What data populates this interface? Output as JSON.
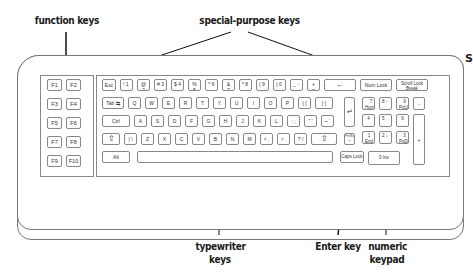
{
  "labels": {
    "function_keys": "function keys",
    "special_purpose_keys": "special-purpose keys",
    "typewriter_keys_line1": "typewriter",
    "typewriter_keys_line2": "keys",
    "enter_key": "Enter key",
    "numeric_keypad_line1": "numeric",
    "numeric_keypad_line2": "keypad",
    "cut_off_right": "S"
  },
  "function_keys": [
    "F1",
    "F2",
    "F3",
    "F4",
    "F5",
    "F6",
    "F7",
    "F8",
    "F9",
    "F10"
  ],
  "rows": {
    "number_row": [
      "Esc",
      "! 1",
      "@ 2",
      "# 3",
      "$ 4",
      "% 5",
      "^ 6",
      "& 7",
      "* 8",
      "( 9",
      ") 0",
      "_ -",
      "+ =",
      "←"
    ],
    "top_special": [
      "Num Lock",
      "Scroll Lock Break"
    ],
    "qwerty_row": [
      "Tab ⇆",
      "Q",
      "W",
      "E",
      "R",
      "T",
      "Y",
      "U",
      "I",
      "O",
      "P",
      "{ [",
      "} ]"
    ],
    "home_row": [
      "Ctrl",
      "A",
      "S",
      "D",
      "F",
      "G",
      "H",
      "J",
      "K",
      "L",
      ": ;",
      "\" '",
      "~ `"
    ],
    "shift_row": [
      "⇧",
      "| \\",
      "Z",
      "X",
      "C",
      "V",
      "B",
      "N",
      "M",
      "< ,",
      "> .",
      "? /",
      "⇧"
    ],
    "bottom_row": [
      "Alt",
      "",
      "Caps Lock"
    ],
    "enter": "↵",
    "prtsc": "PrtSc *"
  },
  "numpad": {
    "row1": [
      "7 Home",
      "8 ↑",
      "9 PgUp",
      "-"
    ],
    "row2": [
      "4 ←",
      "5",
      "6 →",
      "+"
    ],
    "row3": [
      "1 End",
      "2 ↓",
      "3 PgDn"
    ],
    "row4": [
      "0 Ins",
      "Del"
    ]
  }
}
